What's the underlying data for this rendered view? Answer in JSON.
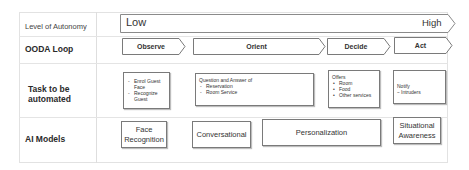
{
  "rows": {
    "autonomy": {
      "label": "Level of Autonomy",
      "low": "Low",
      "high": "High"
    },
    "ooda": {
      "label": "OODA Loop",
      "stages": [
        {
          "label": "Observe"
        },
        {
          "label": "Orient"
        },
        {
          "label": "Decide"
        },
        {
          "label": "Act"
        }
      ]
    },
    "tasks": {
      "label": "Task to be automated",
      "boxes": [
        {
          "heading": "",
          "items": [
            "Enrol Guest Face",
            "Recognize Guest"
          ]
        },
        {
          "heading": "Question and Answer of",
          "items": [
            "Reservation",
            "Room Service"
          ]
        },
        {
          "heading": "Offers",
          "items": [
            "Room",
            "Food",
            "Other services"
          ]
        },
        {
          "heading": "Notify",
          "items": [
            "Intruders"
          ]
        }
      ]
    },
    "models": {
      "label": "AI Models",
      "boxes": [
        {
          "label": "Face Recognition"
        },
        {
          "label": "Conversational"
        },
        {
          "label": "Personalization"
        },
        {
          "label": "Situational Awareness"
        }
      ]
    }
  },
  "colors": {
    "border": "#7a7a7a",
    "grid": "#e2e2e2",
    "text": "#2a2a2a"
  }
}
